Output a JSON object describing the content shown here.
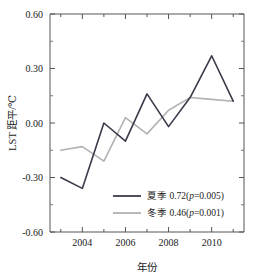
{
  "chart_data": {
    "type": "line",
    "title": "",
    "xlabel": "年份",
    "ylabel": "LST 距平/℃",
    "x": [
      2003,
      2004,
      2005,
      2006,
      2007,
      2008,
      2009,
      2010,
      2011
    ],
    "xlim": [
      2002.5,
      2011.5
    ],
    "ylim": [
      -0.6,
      0.6
    ],
    "xticks": [
      2004,
      2006,
      2008,
      2010
    ],
    "xtick_labels": [
      "2004",
      "2006",
      "2008",
      "2010"
    ],
    "yticks": [
      -0.6,
      -0.3,
      0.0,
      0.3,
      0.6
    ],
    "ytick_labels": [
      "-0.60",
      "-0.30",
      "0.00",
      "0.30",
      "0.60"
    ],
    "minor_ticks": true,
    "grid": false,
    "legend_position": "bottom-center",
    "series": [
      {
        "name": "夏季",
        "label": "夏季 0.72(p=0.005)",
        "label_prefix": "夏季 0.72(",
        "label_italic": "p",
        "label_suffix": "=0.005)",
        "slope": 0.72,
        "p_value": 0.005,
        "color": "#3a3a4a",
        "values": [
          -0.3,
          -0.36,
          0.0,
          -0.1,
          0.16,
          -0.02,
          0.14,
          0.37,
          0.12
        ]
      },
      {
        "name": "冬季",
        "label": "冬季 0.46(p=0.001)",
        "label_prefix": "冬季 0.46(",
        "label_italic": "p",
        "label_suffix": "=0.001)",
        "slope": 0.46,
        "p_value": 0.001,
        "color": "#b2b2b2",
        "values": [
          -0.15,
          -0.13,
          -0.21,
          0.03,
          -0.06,
          0.07,
          0.14,
          0.13,
          0.12
        ]
      }
    ]
  }
}
